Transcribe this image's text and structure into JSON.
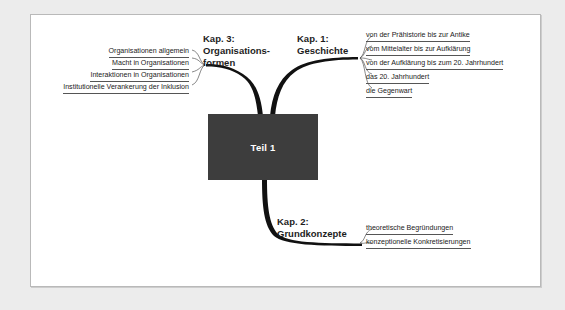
{
  "diagram": {
    "center": {
      "label": "Teil 1",
      "fill": "#3d3d3d",
      "text_color": "#ffffff"
    },
    "page": {
      "background": "#ececec",
      "card_background": "#ffffff",
      "border_color": "#b9b9b9"
    },
    "branches": [
      {
        "id": "kap3",
        "label": "Kap. 3:\nOrganisations-\nformen",
        "position": "upper-left",
        "items": [
          "Organisationen allgemein",
          "Macht in Organisationen",
          "Interaktionen in Organisationen",
          "Institutionelle Verankerung der Inklusion"
        ]
      },
      {
        "id": "kap1",
        "label": "Kap. 1:\nGeschichte",
        "position": "upper-right",
        "items": [
          "von der Prähistorie bis zur Antike",
          "vom Mittelalter bis zur Aufklärung",
          "von der Aufklärung bis zum 20. Jahrhundert",
          "das 20. Jahrhundert",
          "die Gegenwart"
        ]
      },
      {
        "id": "kap2",
        "label": "Kap. 2:\nGrundkonzepte",
        "position": "bottom-right",
        "items": [
          "theoretische Begründungen",
          "konzeptionelle Konkretisierungen"
        ]
      }
    ]
  }
}
